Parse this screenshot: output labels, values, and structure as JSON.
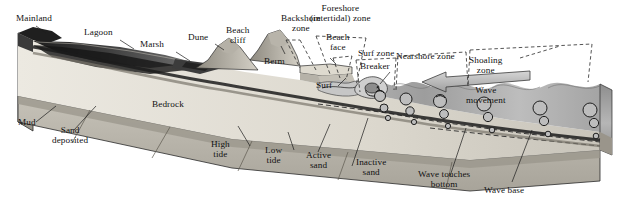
{
  "figure": {
    "type": "block-diagram",
    "background_color": "#ffffff",
    "style": "grayscale halftone geologic block diagram"
  },
  "labels": {
    "mainland": "Mainland",
    "lagoon": "Lagoon",
    "marsh": "Marsh",
    "dune": "Dune",
    "beach_cliff": "Beach\ncliff",
    "berm": "Berm",
    "backshore_zone": "Backshore\nzone",
    "foreshore_zone": "Foreshore\n(intertidal) zone",
    "beach_face": "Beach\nface",
    "surf_zone": "Surf zone",
    "nearshore_zone": "Nearshore zone",
    "shoaling_zone": "Shoaling\nzone",
    "surf": "Surf",
    "breaker": "Breaker",
    "wave_movement": "Wave\nmovement",
    "mud": "Mud",
    "sand_deposited": "Sand\ndeposited",
    "bedrock": "Bedrock",
    "high_tide": "High\ntide",
    "low_tide": "Low\ntide",
    "active_sand": "Active\nsand",
    "inactive_sand": "Inactive\nsand",
    "wave_touches_bottom": "Wave touches\nbottom",
    "wave_base": "Wave base"
  },
  "colors": {
    "ink": "#121212",
    "water_dark": "#4e4e4e",
    "water_mid": "#8f8f8f",
    "water_light": "#c9c9c9",
    "sand_light": "#e3e0d8",
    "sand_mid": "#cdc9bf",
    "bedrock": "#b9b5ab",
    "bedrock_dark": "#9a958b",
    "lagoon_dark": "#2b2b2b",
    "dune_face": "#d8d4ca",
    "outline": "#2a2a2a"
  },
  "zone_order": [
    "Backshore zone",
    "Foreshore (intertidal) zone",
    "Surf zone",
    "Nearshore zone",
    "Shoaling zone"
  ],
  "wave_orbitals": {
    "note": "circular orbital motion shrinks with depth down to wave base",
    "columns": 6,
    "max_radius_px": 7,
    "min_radius_px": 2
  }
}
